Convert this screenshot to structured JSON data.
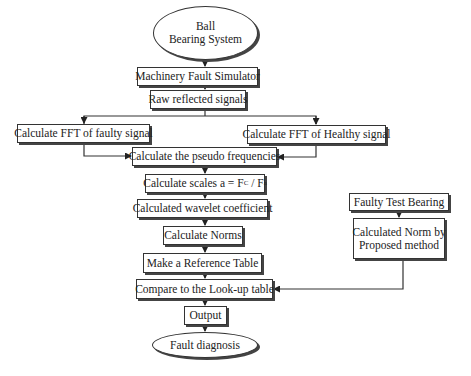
{
  "diagram": {
    "type": "flowchart",
    "nodes": {
      "start": {
        "line1": "Ball",
        "line2": "Bearing System"
      },
      "simulator": "Machinery Fault Simulator",
      "raw": "Raw reflected signals",
      "fft_faulty": "Calculate FFT of faulty signal",
      "fft_healthy": "Calculate FFT of Healthy signal",
      "pseudo": "Calculate the pseudo frequencies",
      "scales": {
        "prefix": "Calculate scales a = F",
        "sub1": "C",
        "mid": "/ F",
        "sub2": "a"
      },
      "wavelet": "Calculated wavelet coefficient",
      "norms": "Calculate Norms",
      "reference": "Make a Reference Table",
      "compare": "Compare to the Look-up table",
      "output": "Output",
      "end": "Fault diagnosis",
      "test_bearing": "Faulty Test Bearing",
      "norm_method": {
        "line1": "Calculated Norm by",
        "line2": "Proposed method"
      }
    },
    "edges": [
      [
        "start",
        "simulator"
      ],
      [
        "simulator",
        "raw"
      ],
      [
        "raw",
        "fft_faulty"
      ],
      [
        "raw",
        "fft_healthy"
      ],
      [
        "fft_faulty",
        "pseudo"
      ],
      [
        "fft_healthy",
        "pseudo"
      ],
      [
        "pseudo",
        "scales"
      ],
      [
        "scales",
        "wavelet"
      ],
      [
        "wavelet",
        "norms"
      ],
      [
        "norms",
        "reference"
      ],
      [
        "reference",
        "compare"
      ],
      [
        "test_bearing",
        "norm_method"
      ],
      [
        "norm_method",
        "compare"
      ],
      [
        "compare",
        "output"
      ],
      [
        "output",
        "end"
      ]
    ]
  }
}
